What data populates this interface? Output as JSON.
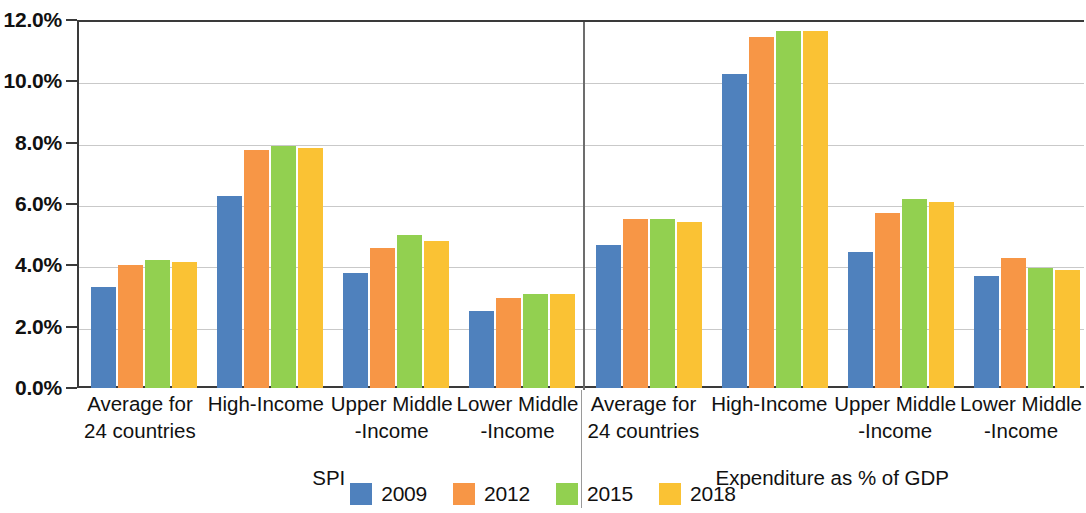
{
  "chart_data": {
    "type": "bar",
    "title": "",
    "subtitle": "",
    "xlabel": "",
    "ylabel": "",
    "ylim": [
      0,
      12
    ],
    "y_ticks": [
      "0.0%",
      "2.0%",
      "4.0%",
      "6.0%",
      "8.0%",
      "10.0%",
      "12.0%"
    ],
    "y_tick_values": [
      0,
      2,
      4,
      6,
      8,
      10,
      12
    ],
    "grid": true,
    "legend_position": "bottom",
    "panels": [
      {
        "name": "SPI",
        "categories": [
          "Average for\n24 countries",
          "High-Income",
          "Upper Middle\n-Income",
          "Lower Middle\n-Income"
        ],
        "series": [
          {
            "name": "2009",
            "values": [
              3.3,
              6.25,
              3.75,
              2.5
            ]
          },
          {
            "name": "2012",
            "values": [
              4.0,
              7.75,
              4.55,
              2.95
            ]
          },
          {
            "name": "2015",
            "values": [
              4.17,
              7.9,
              5.0,
              3.05
            ]
          },
          {
            "name": "2018",
            "values": [
              4.12,
              7.83,
              4.8,
              3.05
            ]
          }
        ]
      },
      {
        "name": "Expenditure as % of GDP",
        "categories": [
          "Average for\n24 countries",
          "High-Income",
          "Upper Middle\n-Income",
          "Lower Middle\n-Income"
        ],
        "series": [
          {
            "name": "2009",
            "values": [
              4.65,
              10.25,
              4.45,
              3.65
            ]
          },
          {
            "name": "2012",
            "values": [
              5.52,
              11.45,
              5.7,
              4.25
            ]
          },
          {
            "name": "2015",
            "values": [
              5.5,
              11.65,
              6.15,
              3.9
            ]
          },
          {
            "name": "2018",
            "values": [
              5.42,
              11.63,
              6.08,
              3.85
            ]
          }
        ]
      }
    ],
    "series_colors": [
      "#4f81bd",
      "#f79646",
      "#92d050",
      "#fac234"
    ],
    "legend": [
      {
        "label": "2009",
        "color": "#4f81bd"
      },
      {
        "label": "2012",
        "color": "#f79646"
      },
      {
        "label": "2015",
        "color": "#92d050"
      },
      {
        "label": "2018",
        "color": "#fac234"
      }
    ]
  }
}
